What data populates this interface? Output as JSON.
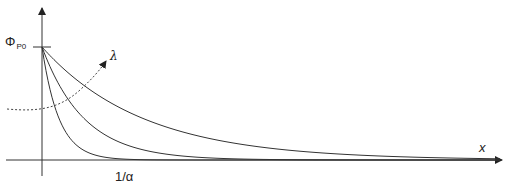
{
  "diagram": {
    "y_axis_label": {
      "symbol": "Φ",
      "subscript": "P0"
    },
    "x_axis_label": "x",
    "parameter_label": "λ",
    "x_tick_label": "1/α",
    "curves": [
      {
        "name": "short-decay",
        "decay_length_px": 17
      },
      {
        "name": "medium-decay",
        "decay_length_px": 42
      },
      {
        "name": "long-decay",
        "decay_length_px": 101
      }
    ],
    "colors": {
      "line": "#333333",
      "background": "#ffffff"
    }
  }
}
